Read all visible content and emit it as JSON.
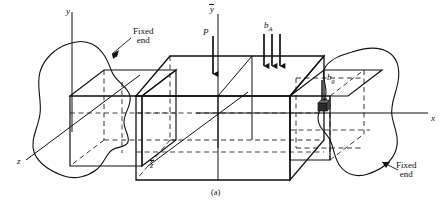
{
  "figure": {
    "caption": "(a)",
    "background_color": "#ffffff",
    "line_color": "#111111",
    "hidden_line_style": "dashed"
  },
  "axes": [
    {
      "name": "y-axis",
      "label": "y",
      "overbar": false,
      "direction": "up",
      "origin_label": "left"
    },
    {
      "name": "z-axis",
      "label": "z",
      "overbar": false,
      "direction": "down-left"
    },
    {
      "name": "x-axis",
      "label": "x",
      "overbar": false,
      "direction": "right"
    },
    {
      "name": "y-bar-axis",
      "label": "y",
      "overbar": true,
      "direction": "up",
      "origin_label": "mid"
    },
    {
      "name": "z-bar-axis",
      "label": "z",
      "overbar": true,
      "direction": "down-left"
    }
  ],
  "loads": [
    {
      "name": "point-load",
      "label": "P",
      "subscript": "",
      "arrows": 1,
      "direction": "down"
    },
    {
      "name": "distributed-load",
      "label": "b",
      "subscript": "A",
      "arrows": 3,
      "direction": "down"
    },
    {
      "name": "body-force",
      "label": "b",
      "subscript": "g",
      "arrows": 1,
      "direction": "down"
    }
  ],
  "annotations": [
    {
      "name": "fixed-end-left",
      "line1": "Fixed",
      "line2": "end"
    },
    {
      "name": "fixed-end-right",
      "line1": "Fixed",
      "line2": "end"
    }
  ],
  "element": {
    "name": "differential-element-cube",
    "label": ""
  }
}
